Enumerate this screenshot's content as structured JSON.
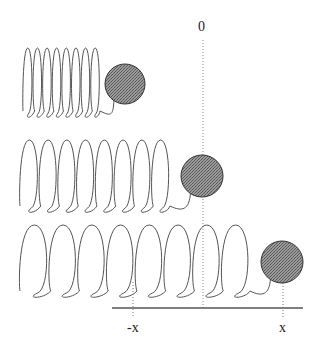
{
  "diagram": {
    "type": "spring-mass oscillation (compressed, equilibrium, stretched)",
    "labels": {
      "zero": "0",
      "neg_x": "-x",
      "pos_x": "x"
    },
    "colors": {
      "spring": "#555555",
      "ball_fill": "#8a8a8a",
      "ball_stroke": "#333333",
      "ground": "#555555",
      "dotted": "#777777"
    },
    "springs": [
      {
        "name": "compressed",
        "x_start": 23,
        "x_end": 100,
        "coils": 8,
        "top": 48,
        "bottom": 115,
        "ball": {
          "cx": 125,
          "cy": 84,
          "r": 20
        }
      },
      {
        "name": "equilibrium",
        "x_start": 20,
        "x_end": 170,
        "coils": 8,
        "top": 140,
        "bottom": 210,
        "ball": {
          "cx": 202,
          "cy": 176,
          "r": 21
        }
      },
      {
        "name": "stretched",
        "x_start": 20,
        "x_end": 250,
        "coils": 8,
        "top": 225,
        "bottom": 295,
        "ball": {
          "cx": 282,
          "cy": 262,
          "r": 21
        }
      }
    ]
  }
}
